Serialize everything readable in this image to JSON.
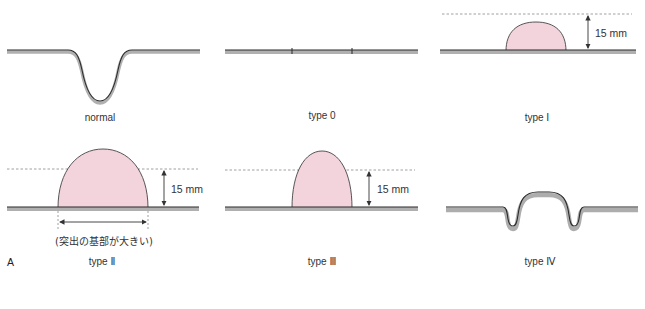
{
  "figure": {
    "panel_letter": "A",
    "colors": {
      "lesion_fill": "#f3d3dc",
      "outline": "#333333",
      "mucosa_band": "#a9a9a9",
      "dashed_line": "#777777"
    },
    "panels": [
      {
        "id": "normal",
        "label": "normal"
      },
      {
        "id": "type0",
        "label": "type 0"
      },
      {
        "id": "type1",
        "label": "type Ⅰ",
        "height_label": "15 mm"
      },
      {
        "id": "type2",
        "label": "type Ⅱ",
        "height_label": "15 mm",
        "base_note": "(突出の基部が大きい)"
      },
      {
        "id": "type3",
        "label": "type Ⅲ",
        "height_label": "15 mm"
      },
      {
        "id": "type4",
        "label": "type Ⅳ"
      }
    ]
  }
}
